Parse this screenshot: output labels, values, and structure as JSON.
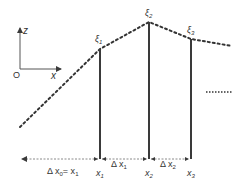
{
  "axes": {
    "origin_label": "O",
    "x_label": "x",
    "z_label": "z"
  },
  "curve": {
    "style": "dotted",
    "points": [
      [
        20,
        127
      ],
      [
        100,
        49
      ],
      [
        149,
        22
      ],
      [
        191,
        39
      ],
      [
        232,
        46
      ]
    ]
  },
  "nodes": [
    {
      "xi_base": "ξ",
      "xi_sub": "1",
      "x_base": "x",
      "x_sub": "1",
      "px": 100,
      "py": 49
    },
    {
      "xi_base": "ξ",
      "xi_sub": "2",
      "x_base": "x",
      "x_sub": "2",
      "px": 149,
      "py": 22
    },
    {
      "xi_base": "ξ",
      "xi_sub": "3",
      "x_base": "x",
      "x_sub": "3",
      "px": 191,
      "py": 39
    }
  ],
  "intervals": [
    {
      "label_base": "Δ x",
      "label_sub": "0",
      "label_suffix": "= x",
      "label_suffix_sub": "1"
    },
    {
      "label_base": "Δ x",
      "label_sub": "1"
    },
    {
      "label_base": "Δ x",
      "label_sub": "2"
    }
  ],
  "continuation": "......",
  "colors": {
    "line": "#3a3a3a",
    "dimension": "#8a8a8a",
    "text": "#333333"
  }
}
